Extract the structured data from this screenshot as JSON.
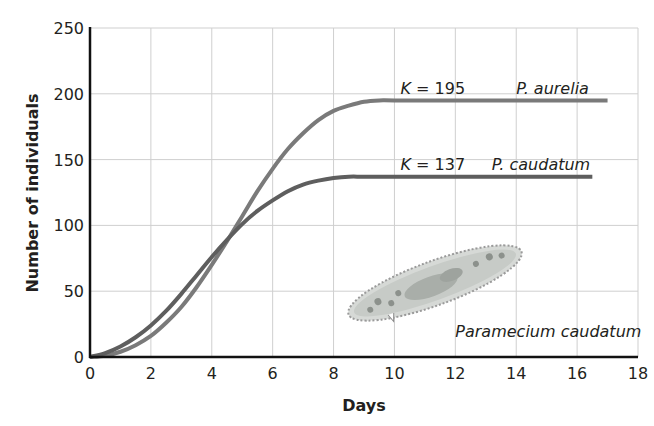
{
  "chart_data": {
    "type": "line",
    "title": "",
    "xlabel": "Days",
    "ylabel": "Number of individuals",
    "xlim": [
      0,
      18
    ],
    "ylim": [
      0,
      250
    ],
    "xticks": [
      0,
      2,
      4,
      6,
      8,
      10,
      12,
      14,
      16,
      18
    ],
    "yticks": [
      0,
      50,
      100,
      150,
      200,
      250
    ],
    "grid": true,
    "legend": "inline labels at curve ends",
    "series": [
      {
        "name": "P. aurelia",
        "color": "#7a7a7a",
        "carrying_capacity_label": "K = 195",
        "K": 195,
        "x": [
          0,
          0.5,
          1,
          1.5,
          2,
          2.5,
          3,
          3.5,
          4,
          4.5,
          5,
          5.5,
          6,
          6.5,
          7,
          7.5,
          8,
          8.5,
          9,
          9.5,
          10,
          12,
          14,
          16,
          17
        ],
        "values": [
          0,
          1,
          4,
          9,
          16,
          26,
          38,
          53,
          70,
          88,
          107,
          126,
          143,
          158,
          170,
          180,
          187,
          191,
          194,
          195,
          195,
          195,
          195,
          195,
          195
        ]
      },
      {
        "name": "P. caudatum",
        "color": "#5e5e5e",
        "carrying_capacity_label": "K = 137",
        "K": 137,
        "x": [
          0,
          0.5,
          1,
          1.5,
          2,
          2.5,
          3,
          3.5,
          4,
          4.5,
          5,
          5.5,
          6,
          6.5,
          7,
          7.5,
          8,
          8.5,
          9,
          10,
          12,
          14,
          16,
          16.5
        ],
        "values": [
          0,
          3,
          8,
          15,
          24,
          35,
          48,
          62,
          76,
          89,
          101,
          111,
          119,
          126,
          131,
          134,
          136,
          137,
          137,
          137,
          137,
          137,
          137,
          137
        ]
      }
    ],
    "annotations": [
      {
        "text": "K = 195",
        "x": 10.2,
        "y": 200
      },
      {
        "text": "P. aurelia",
        "x": 14.0,
        "y": 200
      },
      {
        "text": "K = 137",
        "x": 10.2,
        "y": 142
      },
      {
        "text": "P. caudatum",
        "x": 13.2,
        "y": 142
      },
      {
        "text": "Paramecium caudatum",
        "x": 12.0,
        "y": 20
      }
    ],
    "image_label": "Paramecium caudatum"
  }
}
